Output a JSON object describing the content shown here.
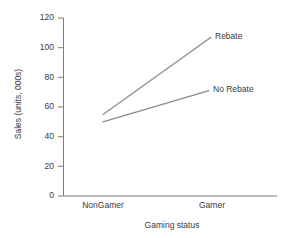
{
  "chart_data": {
    "type": "line",
    "title": "",
    "subtitle": "",
    "xlabel": "Gaming status",
    "ylabel": "Sales (units, 000s)",
    "categories": [
      "NonGamer",
      "Gamer"
    ],
    "series": [
      {
        "name": "Rebate",
        "values": [
          55,
          107
        ]
      },
      {
        "name": "No Rebate",
        "values": [
          50,
          71
        ]
      }
    ],
    "ytick_labels": [
      "0",
      "20",
      "40",
      "60",
      "80",
      "100",
      "120"
    ],
    "ytick_values": [
      0,
      20,
      40,
      60,
      80,
      100,
      120
    ],
    "ylim": [
      0,
      120
    ],
    "grid": false,
    "legend_position": "inline-right-of-line-ends",
    "annotations": [
      {
        "text": "Rebate",
        "anchor": "end-of-rebate-line"
      },
      {
        "text": "No Rebate",
        "anchor": "end-of-no-rebate-line"
      }
    ],
    "colors": {
      "line": "#8a8a8a",
      "axis": "#7d7d7d",
      "text": "#3a3a3a",
      "background": "#ffffff"
    }
  }
}
